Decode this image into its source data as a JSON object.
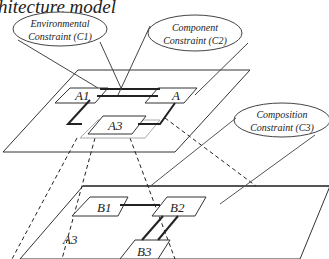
{
  "title": "hitecture model",
  "constraints": {
    "c1": {
      "line1": "Environmental",
      "line2": "Constraint (C1)"
    },
    "c2": {
      "line1": "Component",
      "line2": "Constraint (C2)"
    },
    "c3": {
      "line1": "Composition",
      "line2": "Constraint (C3)"
    }
  },
  "top_plane": {
    "components": [
      "A1",
      "A",
      "A3"
    ]
  },
  "bottom_plane": {
    "label": "A3",
    "components": [
      "B1",
      "B2",
      "B3"
    ]
  },
  "colors": {
    "stroke": "#222222",
    "thin": "#555555",
    "background": "#ffffff"
  }
}
